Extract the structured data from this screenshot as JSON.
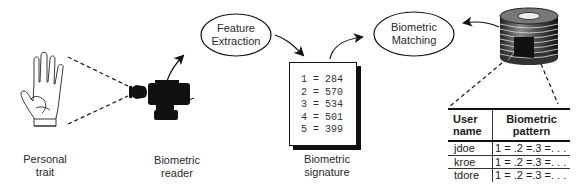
{
  "diagram": {
    "nodes": {
      "personal_trait": {
        "label_line1": "Personal",
        "label_line2": "trait"
      },
      "biometric_reader": {
        "label_line1": "Biometric",
        "label_line2": "reader"
      },
      "feature_extraction": {
        "label_line1": "Feature",
        "label_line2": "Extraction"
      },
      "biometric_signature": {
        "label_line1": "Biometric",
        "label_line2": "signature",
        "values": [
          "1 = 284",
          "2 = 570",
          "3 = 534",
          "4 = 501",
          "5 = 399"
        ]
      },
      "biometric_matching": {
        "label_line1": "Biometric",
        "label_line2": "Matching"
      },
      "database": {
        "table": {
          "headers": [
            {
              "line1": "User",
              "line2": "name"
            },
            {
              "line1": "Biometric",
              "line2": "pattern"
            }
          ],
          "rows": [
            {
              "user": "jdoe",
              "pattern": "1 = .2 =.3 =. . ."
            },
            {
              "user": "kroe",
              "pattern": "1 = .2 =.3 =. . ."
            },
            {
              "user": "tdore",
              "pattern": "1 = .2 =.3 =. . ."
            }
          ]
        }
      }
    },
    "edges": [
      {
        "from": "personal_trait",
        "to": "biometric_reader",
        "style": "dashed"
      },
      {
        "from": "biometric_reader",
        "to": "feature_extraction",
        "style": "arrow"
      },
      {
        "from": "feature_extraction",
        "to": "biometric_signature",
        "style": "arrow"
      },
      {
        "from": "biometric_signature",
        "to": "biometric_matching",
        "style": "arrow"
      },
      {
        "from": "database",
        "to": "biometric_matching",
        "style": "arrow"
      },
      {
        "from": "database",
        "to": "database_table",
        "style": "dashed"
      }
    ]
  }
}
